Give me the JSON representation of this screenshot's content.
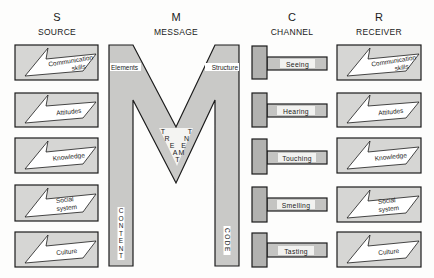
{
  "columns": {
    "source": {
      "letter": "S",
      "title": "SOURCE"
    },
    "message": {
      "letter": "M",
      "title": "MESSAGE"
    },
    "channel": {
      "letter": "C",
      "title": "CHANNEL"
    },
    "receiver": {
      "letter": "R",
      "title": "RECEIVER"
    }
  },
  "source": {
    "items": [
      {
        "line1": "Communication",
        "line2": "skills"
      },
      {
        "line1": "Attitudes",
        "line2": ""
      },
      {
        "line1": "Knowledge",
        "line2": ""
      },
      {
        "line1": "Social",
        "line2": "system"
      },
      {
        "line1": "Culture",
        "line2": ""
      }
    ]
  },
  "message": {
    "elements": "Elements",
    "structure": "Structure",
    "treatment_letters": [
      "T",
      "R",
      "E",
      "A",
      "T",
      "M",
      "E",
      "N",
      "T"
    ],
    "content_letters": [
      "C",
      "O",
      "N",
      "T",
      "E",
      "N",
      "T"
    ],
    "code": "CODE"
  },
  "channel": {
    "items": [
      "Seeing",
      "Hearing",
      "Touching",
      "Smelling",
      "Tasting"
    ]
  },
  "receiver": {
    "items": [
      {
        "line1": "Communication",
        "line2": "skills"
      },
      {
        "line1": "Attitudes",
        "line2": ""
      },
      {
        "line1": "Knowledge",
        "line2": ""
      },
      {
        "line1": "Social",
        "line2": "system"
      },
      {
        "line1": "Culture",
        "line2": ""
      }
    ]
  },
  "colors": {
    "box_fill": "#d6d6d4",
    "m_fill": "#c9c9c7",
    "t_block": "#b2b2b0",
    "t_bar": "#c4c4c2",
    "stroke": "#1b1b1b"
  }
}
